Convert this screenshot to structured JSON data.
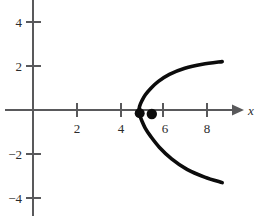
{
  "chart_data": {
    "type": "line",
    "title": "",
    "subtitle": "",
    "xlabel": "x",
    "ylabel": "",
    "xlim": [
      -0.6,
      10.4
    ],
    "ylim": [
      -5.0,
      5.0
    ],
    "grid": false,
    "legend": null,
    "xticks": [
      2,
      4,
      6,
      8
    ],
    "xticklabels": [
      "2",
      "4",
      "6",
      "8"
    ],
    "yticks": [
      4,
      2,
      -2,
      -4
    ],
    "yticklabels": [
      "4",
      "2",
      "-2",
      "-4"
    ],
    "axis_arrow": "x-positive",
    "series": [
      {
        "name": "parabola-upper-branch",
        "x": [
          4.82,
          4.85,
          4.95,
          5.1,
          5.35,
          5.7,
          6.2,
          6.9,
          7.7,
          8.6
        ],
        "y": [
          0.0,
          0.18,
          0.42,
          0.68,
          0.98,
          1.3,
          1.62,
          1.9,
          2.08,
          2.2
        ]
      },
      {
        "name": "parabola-lower-branch",
        "x": [
          4.82,
          4.85,
          4.95,
          5.1,
          5.35,
          5.75,
          6.3,
          7.0,
          7.8,
          8.6
        ],
        "y": [
          0.0,
          -0.22,
          -0.5,
          -0.82,
          -1.2,
          -1.7,
          -2.22,
          -2.7,
          -3.05,
          -3.3
        ]
      }
    ],
    "points": [
      {
        "name": "vertex-point",
        "x": 4.85,
        "y": -0.15,
        "r": 5.0,
        "label": ""
      },
      {
        "name": "focus-point",
        "x": 5.4,
        "y": -0.18,
        "r": 5.2,
        "label": ""
      }
    ],
    "colors": {
      "curve": "#0c0c0c",
      "axis": "#59595b",
      "point": "#0c0c0c",
      "text": "#2b2b2b",
      "background": "#ffffff"
    }
  },
  "labels": {
    "x_axis_name": "x",
    "tick_2": "2",
    "tick_4": "4",
    "tick_6": "6",
    "tick_8": "8",
    "tick_y4": "4",
    "tick_y2": "2",
    "tick_yneg2": "−2",
    "tick_yneg4": "−4"
  }
}
